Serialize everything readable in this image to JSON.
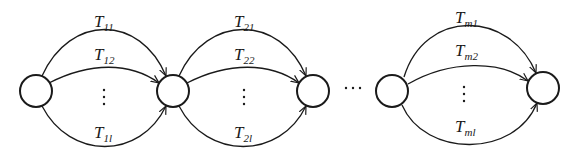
{
  "diagram": {
    "type": "series-parallel transition network",
    "stroke_color": "#1a1a1a",
    "background": "#ffffff",
    "nodes": [
      {
        "id": "n0",
        "cx": 36,
        "cy": 91,
        "r": 16
      },
      {
        "id": "n1",
        "cx": 173,
        "cy": 91,
        "r": 16
      },
      {
        "id": "n2",
        "cx": 313,
        "cy": 91,
        "r": 16
      },
      {
        "id": "n3",
        "cx": 392,
        "cy": 91,
        "r": 16
      },
      {
        "id": "n4",
        "cx": 543,
        "cy": 88,
        "r": 16
      }
    ],
    "stages": [
      {
        "from": "n0",
        "to": "n1",
        "labels": {
          "top": {
            "base": "T",
            "sub": "11",
            "sub_italic": false
          },
          "mid": {
            "base": "T",
            "sub": "12",
            "sub_italic": false
          },
          "bottom": {
            "base": "T",
            "sub": "1l",
            "sub_italic": true
          }
        },
        "vdots": "⋮"
      },
      {
        "from": "n1",
        "to": "n2",
        "labels": {
          "top": {
            "base": "T",
            "sub": "21",
            "sub_italic": false
          },
          "mid": {
            "base": "T",
            "sub": "22",
            "sub_italic": false
          },
          "bottom": {
            "base": "T",
            "sub": "2l",
            "sub_italic": true
          }
        },
        "vdots": "⋮"
      },
      {
        "from": "n3",
        "to": "n4",
        "labels": {
          "top": {
            "base": "T",
            "sub": "m1",
            "sub_italic": true
          },
          "mid": {
            "base": "T",
            "sub": "m2",
            "sub_italic": true
          },
          "bottom": {
            "base": "T",
            "sub": "ml",
            "sub_italic": true
          }
        },
        "vdots": "⋮"
      }
    ],
    "hdots": "⋯",
    "stage_text": {
      "s0_top_base": "T",
      "s0_top_sub": "11",
      "s0_mid_base": "T",
      "s0_mid_sub": "12",
      "s0_bot_base": "T",
      "s0_bot_sub": "1l",
      "s1_top_base": "T",
      "s1_top_sub": "21",
      "s1_mid_base": "T",
      "s1_mid_sub": "22",
      "s1_bot_base": "T",
      "s1_bot_sub": "2l",
      "s2_top_base": "T",
      "s2_top_sub": "m1",
      "s2_mid_base": "T",
      "s2_mid_sub": "m2",
      "s2_bot_base": "T",
      "s2_bot_sub": "ml"
    }
  }
}
